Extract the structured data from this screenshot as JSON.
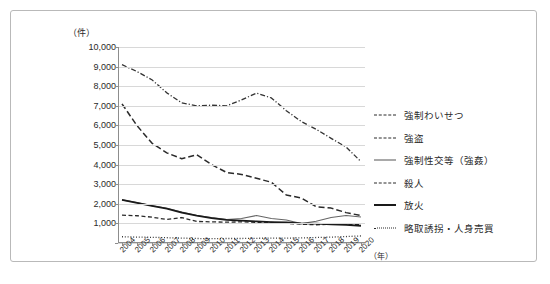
{
  "axis": {
    "y_unit": "（件）",
    "x_unit": "（年）",
    "y_ticks": [
      "10,000",
      "9,000",
      "8,000",
      "7,000",
      "6,000",
      "5,000",
      "4,000",
      "3,000",
      "2,000",
      "1,000",
      ""
    ],
    "x_ticks": [
      "2004",
      "2005",
      "2006",
      "2007",
      "2008",
      "2009",
      "2010",
      "2011",
      "2012",
      "2013",
      "2014",
      "2015",
      "2016",
      "2017",
      "2018",
      "2019",
      "2020"
    ]
  },
  "legend": {
    "items": [
      {
        "label": "強制わいせつ",
        "style": "dashdot"
      },
      {
        "label": "強盗",
        "style": "dashed"
      },
      {
        "label": "強制性交等（強姦）",
        "style": "solid-thin"
      },
      {
        "label": "殺人",
        "style": "dashed-short"
      },
      {
        "label": "放火",
        "style": "solid-thick"
      },
      {
        "label": "略取誘拐・人身売買",
        "style": "dotted"
      }
    ]
  },
  "chart_data": {
    "type": "line",
    "title": "",
    "xlabel": "（年）",
    "ylabel": "（件）",
    "ylim": [
      0,
      10000
    ],
    "ytick_step": 1000,
    "grid": true,
    "legend_position": "right",
    "x": [
      2004,
      2005,
      2006,
      2007,
      2008,
      2009,
      2010,
      2011,
      2012,
      2013,
      2014,
      2015,
      2016,
      2017,
      2018,
      2019,
      2020
    ],
    "series": [
      {
        "name": "強制わいせつ",
        "style": "dashdot",
        "values": [
          9100,
          8750,
          8330,
          7660,
          7150,
          7000,
          7030,
          7000,
          7300,
          7650,
          7400,
          6750,
          6200,
          5800,
          5340,
          4900,
          4150
        ]
      },
      {
        "name": "強盗",
        "style": "dashed",
        "values": [
          7100,
          5990,
          5100,
          4600,
          4300,
          4500,
          4000,
          3600,
          3500,
          3300,
          3100,
          2450,
          2300,
          1850,
          1780,
          1550,
          1400
        ]
      },
      {
        "name": "強制性交等（強姦）",
        "style": "solid-thin",
        "values": [
          2200,
          2070,
          1900,
          1770,
          1580,
          1400,
          1300,
          1200,
          1250,
          1400,
          1250,
          1170,
          990,
          1110,
          1300,
          1400,
          1330
        ]
      },
      {
        "name": "殺人",
        "style": "dashed-short",
        "values": [
          1420,
          1390,
          1320,
          1200,
          1300,
          1100,
          1080,
          1060,
          1080,
          1050,
          1050,
          1000,
          960,
          930,
          960,
          960,
          930
        ]
      },
      {
        "name": "放火",
        "style": "solid-thick",
        "values": [
          2200,
          2050,
          1900,
          1750,
          1550,
          1400,
          1270,
          1180,
          1140,
          1100,
          1070,
          1050,
          1000,
          990,
          950,
          920,
          880
        ]
      },
      {
        "name": "略取誘拐・人身売買",
        "style": "dotted",
        "values": [
          320,
          300,
          290,
          270,
          250,
          230,
          220,
          230,
          230,
          240,
          250,
          250,
          260,
          280,
          300,
          330,
          360
        ]
      }
    ]
  }
}
